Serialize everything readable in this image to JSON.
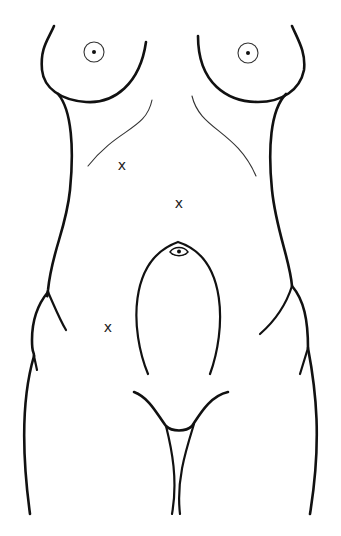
{
  "diagram": {
    "marks": [
      {
        "label": "x",
        "x": 122,
        "y": 166
      },
      {
        "label": "x",
        "x": 179,
        "y": 204
      },
      {
        "label": "x",
        "x": 108,
        "y": 328
      }
    ],
    "colors": {
      "line": "#111111",
      "background": "#ffffff"
    }
  }
}
